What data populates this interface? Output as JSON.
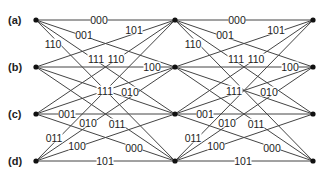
{
  "diagram": {
    "type": "trellis",
    "states": [
      {
        "id": "a",
        "label": "(a)",
        "y": 20
      },
      {
        "id": "b",
        "label": "(b)",
        "y": 67
      },
      {
        "id": "c",
        "label": "(c)",
        "y": 114
      },
      {
        "id": "d",
        "label": "(d)",
        "y": 161
      }
    ],
    "columns_x": [
      36,
      175,
      313
    ],
    "stages": [
      {
        "from_x": 36,
        "to_x": 175,
        "edges": [
          {
            "from": "a",
            "to": "a",
            "label": "000",
            "lx": 99,
            "ly": 20
          },
          {
            "from": "a",
            "to": "b",
            "label": "001",
            "lx": 84,
            "ly": 35
          },
          {
            "from": "a",
            "to": "c",
            "label": "111",
            "lx": 96,
            "ly": 59
          },
          {
            "from": "a",
            "to": "d",
            "label": "110",
            "lx": 53,
            "ly": 44
          },
          {
            "from": "b",
            "to": "a",
            "label": "101",
            "lx": 134,
            "ly": 30
          },
          {
            "from": "b",
            "to": "b",
            "label": "100",
            "lx": 152,
            "ly": 67
          },
          {
            "from": "b",
            "to": "c",
            "label": "010",
            "lx": 130,
            "ly": 92
          },
          {
            "from": "b",
            "to": "d",
            "label": "000",
            "lx": 134,
            "ly": 148
          },
          {
            "from": "c",
            "to": "a",
            "label": "110",
            "lx": 116,
            "ly": 59
          },
          {
            "from": "c",
            "to": "b",
            "label": "111",
            "lx": 105,
            "ly": 91
          },
          {
            "from": "c",
            "to": "c",
            "label": "001",
            "lx": 67,
            "ly": 114
          },
          {
            "from": "c",
            "to": "d",
            "label": "011",
            "lx": 117,
            "ly": 124
          },
          {
            "from": "d",
            "to": "a",
            "label": "011",
            "lx": 54,
            "ly": 138
          },
          {
            "from": "d",
            "to": "b",
            "label": "010",
            "lx": 88,
            "ly": 123
          },
          {
            "from": "d",
            "to": "c",
            "label": "100",
            "lx": 77,
            "ly": 146
          },
          {
            "from": "d",
            "to": "d",
            "label": "101",
            "lx": 105,
            "ly": 161
          }
        ]
      },
      {
        "from_x": 175,
        "to_x": 313,
        "edges": [
          {
            "from": "a",
            "to": "a",
            "label": "000",
            "lx": 237,
            "ly": 20
          },
          {
            "from": "a",
            "to": "b",
            "label": "001",
            "lx": 225,
            "ly": 35
          },
          {
            "from": "a",
            "to": "c",
            "label": "111",
            "lx": 236,
            "ly": 59
          },
          {
            "from": "a",
            "to": "d",
            "label": "110",
            "lx": 193,
            "ly": 44
          },
          {
            "from": "b",
            "to": "a",
            "label": "101",
            "lx": 276,
            "ly": 30
          },
          {
            "from": "b",
            "to": "b",
            "label": "100",
            "lx": 290,
            "ly": 67
          },
          {
            "from": "b",
            "to": "c",
            "label": "010",
            "lx": 269,
            "ly": 92
          },
          {
            "from": "b",
            "to": "d",
            "label": "000",
            "lx": 272,
            "ly": 148
          },
          {
            "from": "c",
            "to": "a",
            "label": "110",
            "lx": 256,
            "ly": 59
          },
          {
            "from": "c",
            "to": "b",
            "label": "111",
            "lx": 234,
            "ly": 91
          },
          {
            "from": "c",
            "to": "c",
            "label": "001",
            "lx": 205,
            "ly": 114
          },
          {
            "from": "c",
            "to": "d",
            "label": "011",
            "lx": 256,
            "ly": 124
          },
          {
            "from": "d",
            "to": "a",
            "label": "011",
            "lx": 193,
            "ly": 138
          },
          {
            "from": "d",
            "to": "b",
            "label": "010",
            "lx": 227,
            "ly": 123
          },
          {
            "from": "d",
            "to": "c",
            "label": "100",
            "lx": 216,
            "ly": 146
          },
          {
            "from": "d",
            "to": "d",
            "label": "101",
            "lx": 243,
            "ly": 161
          }
        ]
      }
    ]
  }
}
